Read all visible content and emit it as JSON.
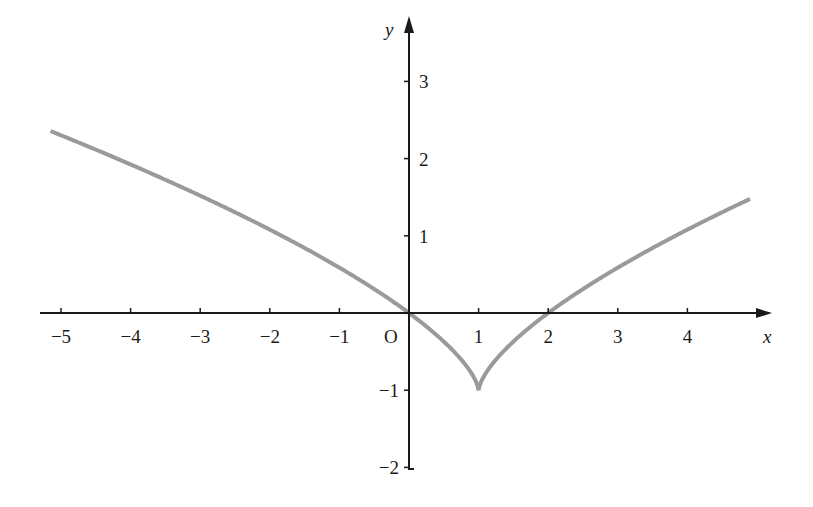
{
  "chart_data": {
    "type": "line",
    "title": "",
    "xlabel": "x",
    "ylabel": "y",
    "origin_label": "O",
    "xlim": [
      -5.2,
      5.0
    ],
    "ylim": [
      -2,
      3.5
    ],
    "grid": false,
    "legend": null,
    "x_ticks": [
      -5,
      -4,
      -3,
      -2,
      -1,
      1,
      2,
      3,
      4
    ],
    "x_tick_labels": [
      "−5",
      "−4",
      "−3",
      "−2",
      "−1",
      "1",
      "2",
      "3",
      "4"
    ],
    "y_ticks": [
      3,
      2,
      1,
      -1,
      -2
    ],
    "y_tick_labels": [
      "3",
      "2",
      "1",
      "−1",
      "−2"
    ],
    "series": [
      {
        "name": "y = (x − 1)^(2/3) − 1",
        "color": "#9a9a9a",
        "x": [
          -5.15,
          -5,
          -4,
          -3,
          -2,
          -1,
          0,
          0.5,
          0.9,
          1,
          1.1,
          1.5,
          2,
          3,
          4,
          4.9
        ],
        "y": [
          2.36,
          2.3,
          1.92,
          1.52,
          1.08,
          0.59,
          0,
          -0.37,
          -0.78,
          -1,
          -0.78,
          -0.37,
          0,
          0.59,
          1.08,
          1.48
        ]
      }
    ],
    "annotations": [
      "cusp at (1, −1)",
      "roots at x = 0 and x = 2"
    ]
  },
  "colors": {
    "axis": "#1a1a1a",
    "curve": "#9a9a9a",
    "background": "#ffffff"
  }
}
